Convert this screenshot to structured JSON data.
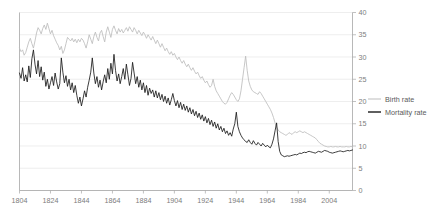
{
  "chart_data": {
    "type": "line",
    "title": "",
    "xlabel": "",
    "ylabel": "",
    "xlim": [
      1804,
      2019
    ],
    "ylim": [
      0,
      40
    ],
    "grid": true,
    "legend_position": "right",
    "x_ticks": [
      1804,
      1824,
      1844,
      1864,
      1884,
      1904,
      1924,
      1944,
      1964,
      1984,
      2004
    ],
    "y_ticks": [
      0,
      5,
      10,
      15,
      20,
      25,
      30,
      35,
      40
    ],
    "x_start": 1804,
    "x_step": 1,
    "series": [
      {
        "name": "Birth rate",
        "color": "#bdbdbd",
        "values": [
          32.0,
          31.2,
          31.6,
          30.4,
          31.0,
          32.2,
          33.4,
          34.2,
          33.0,
          32.0,
          33.6,
          35.4,
          36.6,
          36.0,
          35.2,
          36.4,
          37.2,
          36.2,
          37.6,
          36.4,
          35.2,
          36.0,
          34.8,
          34.0,
          33.2,
          32.6,
          31.6,
          32.4,
          30.8,
          31.6,
          33.0,
          34.4,
          34.0,
          33.6,
          34.2,
          33.4,
          34.0,
          33.2,
          34.0,
          33.4,
          34.2,
          33.8,
          33.0,
          32.0,
          33.4,
          35.0,
          34.0,
          33.0,
          34.6,
          35.6,
          34.4,
          33.6,
          35.4,
          36.0,
          34.6,
          33.4,
          35.6,
          36.8,
          35.6,
          34.4,
          36.2,
          37.0,
          36.0,
          35.2,
          36.4,
          35.6,
          36.2,
          35.4,
          36.0,
          36.6,
          35.8,
          36.8,
          36.2,
          35.6,
          36.6,
          36.0,
          35.2,
          36.0,
          35.4,
          34.8,
          35.6,
          35.0,
          34.2,
          35.0,
          34.4,
          33.8,
          34.6,
          33.8,
          33.0,
          33.8,
          33.0,
          32.2,
          33.0,
          32.2,
          31.4,
          32.0,
          31.2,
          30.6,
          31.2,
          30.4,
          30.8,
          30.0,
          29.4,
          30.0,
          29.2,
          28.6,
          29.2,
          28.4,
          27.8,
          28.4,
          27.6,
          27.0,
          27.6,
          26.8,
          26.2,
          26.6,
          25.8,
          25.2,
          25.6,
          24.8,
          24.2,
          24.6,
          23.8,
          23.2,
          23.6,
          25.0,
          23.4,
          22.4,
          21.8,
          21.2,
          20.6,
          20.0,
          19.6,
          19.4,
          19.8,
          20.6,
          21.4,
          22.0,
          21.6,
          21.0,
          20.4,
          20.0,
          20.6,
          22.4,
          25.0,
          27.6,
          30.2,
          27.0,
          24.6,
          23.4,
          22.6,
          22.2,
          22.0,
          21.8,
          21.6,
          22.2,
          21.8,
          21.2,
          20.6,
          20.0,
          19.4,
          18.8,
          18.2,
          17.4,
          16.4,
          15.2,
          14.2,
          13.6,
          13.2,
          13.0,
          12.8,
          12.6,
          12.4,
          12.6,
          13.0,
          12.8,
          12.6,
          13.0,
          13.2,
          13.0,
          13.2,
          13.4,
          13.2,
          13.0,
          13.2,
          13.0,
          12.8,
          12.6,
          12.4,
          12.2,
          12.0,
          11.8,
          11.4,
          11.0,
          10.6,
          10.4,
          10.2,
          10.0,
          9.9,
          9.8,
          9.8,
          9.9,
          9.8,
          9.8,
          9.9,
          9.8,
          9.8,
          9.9,
          9.8,
          9.8,
          9.8,
          9.9,
          9.8,
          9.8,
          9.9,
          9.8
        ]
      },
      {
        "name": "Mortality rate",
        "color": "#1a1a1a",
        "values": [
          26.4,
          25.2,
          27.6,
          24.6,
          26.0,
          24.4,
          28.0,
          25.4,
          29.6,
          31.6,
          28.4,
          26.2,
          29.2,
          25.6,
          27.8,
          24.8,
          26.6,
          23.4,
          25.0,
          22.8,
          24.2,
          25.6,
          23.6,
          26.4,
          24.4,
          22.8,
          24.0,
          29.8,
          26.6,
          24.2,
          25.8,
          23.4,
          25.0,
          22.6,
          24.2,
          22.0,
          23.6,
          21.4,
          19.6,
          21.0,
          19.0,
          20.6,
          22.4,
          21.0,
          23.2,
          24.8,
          26.6,
          29.8,
          26.4,
          24.0,
          25.6,
          23.2,
          24.8,
          22.6,
          24.4,
          26.0,
          24.2,
          27.4,
          25.0,
          28.6,
          26.2,
          30.6,
          27.0,
          24.6,
          26.2,
          24.0,
          25.6,
          27.4,
          25.0,
          28.4,
          26.0,
          23.6,
          25.2,
          28.8,
          26.4,
          24.0,
          25.6,
          23.2,
          24.8,
          22.6,
          24.2,
          22.0,
          23.6,
          21.4,
          23.0,
          21.8,
          22.6,
          21.0,
          22.4,
          20.8,
          22.0,
          20.4,
          21.6,
          20.0,
          21.2,
          19.6,
          20.8,
          19.2,
          20.4,
          21.8,
          20.2,
          19.0,
          20.2,
          18.6,
          19.8,
          18.2,
          19.4,
          18.0,
          19.0,
          17.6,
          18.6,
          17.2,
          18.2,
          16.8,
          17.8,
          16.4,
          17.4,
          16.0,
          17.0,
          15.6,
          16.6,
          15.2,
          16.2,
          14.8,
          15.8,
          14.4,
          15.4,
          14.0,
          15.0,
          13.6,
          14.4,
          13.2,
          14.0,
          12.8,
          13.4,
          12.4,
          13.0,
          12.2,
          13.8,
          15.0,
          17.6,
          14.4,
          13.2,
          12.4,
          11.8,
          11.4,
          11.0,
          10.8,
          11.4,
          10.8,
          10.4,
          11.2,
          10.6,
          10.2,
          10.8,
          10.4,
          10.0,
          10.6,
          10.2,
          9.8,
          10.2,
          9.8,
          9.6,
          10.4,
          11.6,
          13.4,
          15.2,
          11.0,
          8.8,
          8.0,
          7.8,
          7.6,
          7.7,
          7.8,
          7.7,
          7.8,
          7.9,
          8.0,
          8.1,
          8.0,
          8.2,
          8.4,
          8.3,
          8.5,
          8.6,
          8.5,
          8.7,
          8.8,
          8.7,
          8.6,
          8.5,
          8.4,
          8.6,
          8.8,
          8.7,
          8.6,
          8.8,
          9.0,
          8.9,
          8.8,
          8.6,
          8.5,
          8.4,
          8.5,
          8.6,
          8.7,
          8.8,
          8.9,
          8.8,
          8.7,
          8.8,
          8.9,
          9.0,
          8.9,
          9.0,
          9.1
        ]
      }
    ],
    "legend": [
      {
        "label": "Birth rate",
        "color": "#bdbdbd"
      },
      {
        "label": "Mortality rate",
        "color": "#1a1a1a"
      }
    ]
  }
}
